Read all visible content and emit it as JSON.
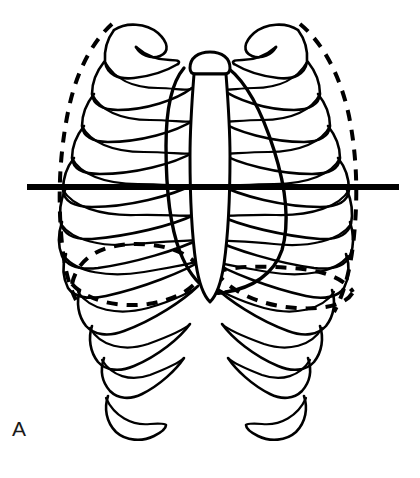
{
  "figure": {
    "panel_label": "A",
    "background_color": "#ffffff",
    "line_color": "#000000",
    "width": 420,
    "height": 478
  },
  "reference_line": {
    "label": "transverse reference level",
    "x_start": 27,
    "x_end": 399,
    "y": 187,
    "thickness": 6,
    "color": "#000000",
    "style": "solid"
  },
  "structures": {
    "rib_cage": {
      "label": "rib cage",
      "style": "solid",
      "rib_pairs": 12,
      "sides": [
        "left",
        "right"
      ]
    },
    "sternum": {
      "label": "sternum",
      "parts": [
        "manubrium",
        "body",
        "xiphoid process"
      ],
      "style": "solid"
    },
    "cardiac_silhouette": {
      "label": "cardiac and mediastinal silhouette",
      "style": "solid"
    },
    "pleural_outline": {
      "label": "lung / pleural outline",
      "style": "dashed",
      "sides": [
        "left",
        "right"
      ]
    },
    "diaphragm": {
      "label": "diaphragm domes",
      "style": "dashed",
      "left_dome_apex_y": 250,
      "right_dome_apex_y": 277,
      "note": "left dome higher than right dome as drawn"
    }
  },
  "legend": {
    "solid_meaning": "bony thorax and cardiac border",
    "dashed_meaning": "lung fields and diaphragm"
  }
}
